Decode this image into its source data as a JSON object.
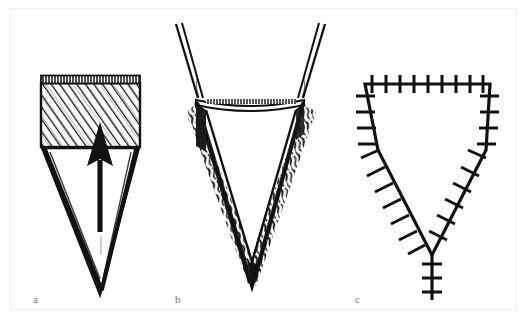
{
  "figure": {
    "type": "surgical-illustration",
    "style": "pen-and-ink line drawing",
    "background_color": "#ffffff",
    "ink_color": "#111111",
    "frame_color": "#efefef",
    "label_color": "#7a7a7a",
    "caption": "",
    "panels": [
      {
        "id": "a",
        "label": "a",
        "description": "Hatched rectangular block above a V-shaped wedge with an upward arrow indicating the direction of advancement",
        "elements": [
          "hatched-rectangle",
          "v-wedge-outline",
          "up-arrow"
        ]
      },
      {
        "id": "b",
        "label": "b",
        "description": "V-shaped wedge defect held open by two retractor hooks at the upper corners, with textured tissue shading along the wedge walls",
        "elements": [
          "retractor-hook-left",
          "retractor-hook-right",
          "v-wedge-open",
          "tissue-texture"
        ]
      },
      {
        "id": "c",
        "label": "c",
        "description": "Closed shield-shaped wound outlined by interrupted sutures with a vertical sutured tail at the apex",
        "elements": [
          "suture-line-top",
          "suture-line-left",
          "suture-line-right",
          "suture-line-tail"
        ]
      }
    ]
  }
}
